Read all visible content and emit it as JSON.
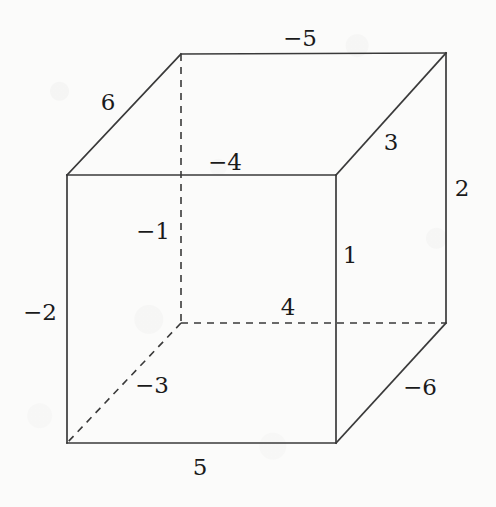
{
  "figure": {
    "type": "cube-diagram",
    "background_color": "#fbfbfa",
    "line_color": "#3a3a3a",
    "text_color": "#1a1a1a"
  },
  "cube": {
    "front_face": {
      "top_left": [
        67,
        175
      ],
      "top_right": [
        336,
        175
      ],
      "bottom_right": [
        336,
        443
      ],
      "bottom_left": [
        67,
        443
      ]
    },
    "back_face": {
      "top_left": [
        181,
        54
      ],
      "top_right": [
        446,
        53
      ],
      "bottom_right": [
        446,
        323
      ],
      "bottom_left": [
        181,
        323
      ]
    },
    "hidden_vertex": [
      181,
      323
    ]
  },
  "edge_labels": [
    {
      "name": "label-neg-5",
      "text": "−5",
      "x": 300,
      "y": 38,
      "edge": "back-top"
    },
    {
      "name": "label-6",
      "text": "6",
      "x": 108,
      "y": 102,
      "edge": "top-left-diagonal"
    },
    {
      "name": "label-3",
      "text": "3",
      "x": 391,
      "y": 142,
      "edge": "top-right-diagonal"
    },
    {
      "name": "label-neg-4",
      "text": "−4",
      "x": 225,
      "y": 162,
      "edge": "front-top"
    },
    {
      "name": "label-2",
      "text": "2",
      "x": 462,
      "y": 188,
      "edge": "back-right-vertical"
    },
    {
      "name": "label-neg-1",
      "text": "−1",
      "x": 153,
      "y": 231,
      "edge": "hidden-vertical"
    },
    {
      "name": "label-1",
      "text": "1",
      "x": 350,
      "y": 255,
      "edge": "front-right-vertical"
    },
    {
      "name": "label-4",
      "text": "4",
      "x": 288,
      "y": 307,
      "edge": "hidden-back-bottom"
    },
    {
      "name": "label-neg-2",
      "text": "−2",
      "x": 40,
      "y": 312,
      "edge": "front-left-vertical"
    },
    {
      "name": "label-neg-3",
      "text": "−3",
      "x": 152,
      "y": 385,
      "edge": "hidden-bottom-diagonal"
    },
    {
      "name": "label-neg-6",
      "text": "−6",
      "x": 420,
      "y": 387,
      "edge": "bottom-right-diagonal"
    },
    {
      "name": "label-5",
      "text": "5",
      "x": 200,
      "y": 467,
      "edge": "front-bottom"
    }
  ]
}
